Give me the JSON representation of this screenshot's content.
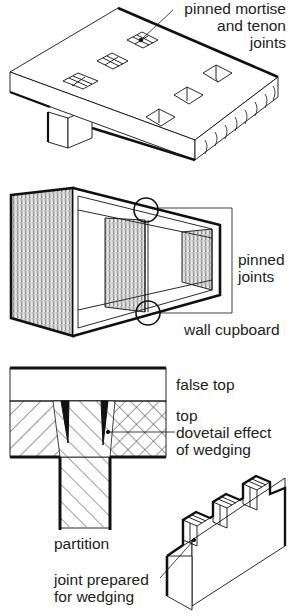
{
  "figures": [
    {
      "id": "table-top",
      "caption_lines": [
        "pinned mortise",
        "and tenon",
        "joints"
      ]
    },
    {
      "id": "wall-cupboard",
      "labels": {
        "pinned_joints": [
          "pinned",
          "joints"
        ],
        "title": "wall cupboard"
      }
    },
    {
      "id": "wedged-section",
      "labels": {
        "false_top": "false top",
        "top": "top",
        "dovetail": [
          "dovetail effect",
          "of wedging"
        ],
        "partition": "partition"
      }
    },
    {
      "id": "wedging-joint",
      "labels": {
        "joint_prepared": [
          "joint prepared",
          "for wedging"
        ]
      }
    }
  ],
  "colors": {
    "ink": "#111111",
    "paper": "#ffffff",
    "text": "#222222"
  }
}
